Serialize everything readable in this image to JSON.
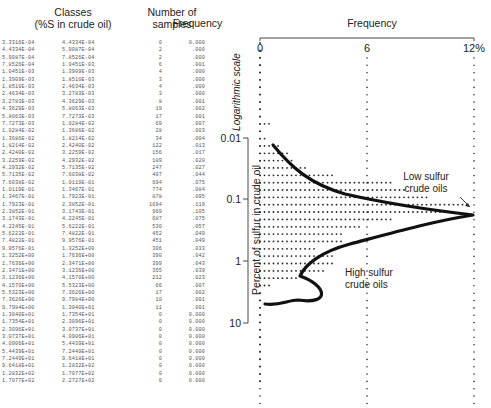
{
  "table": {
    "headers": {
      "classes_line1": "Classes",
      "classes_line2": "(%S in crude oil)",
      "samples_line1": "Number of",
      "samples_line2": "samples",
      "frequency": "Frequency"
    },
    "rows": [
      [
        "3.3316E-04",
        "4.4334E-04",
        "0",
        "0.000"
      ],
      [
        "4.4334E-04",
        "5.9087E-04",
        "2",
        ".000"
      ],
      [
        "5.9087E-04",
        "7.8526E-04",
        "2",
        ".000"
      ],
      [
        "7.8526E-04",
        "1.0451E-03",
        "6",
        ".001"
      ],
      [
        "1.0451E-03",
        "1.3909E-03",
        "4",
        ".000"
      ],
      [
        "1.3909E-03",
        "1.8510E-03",
        "3",
        ".000"
      ],
      [
        "1.8510E-03",
        "2.4634E-03",
        "4",
        ".000"
      ],
      [
        "2.4634E-03",
        "3.2783E-03",
        "3",
        ".000"
      ],
      [
        "3.2783E-03",
        "4.3629E-03",
        "8",
        ".001"
      ],
      [
        "4.3629E-03",
        "5.8063E-03",
        "19",
        ".002"
      ],
      [
        "5.8063E-03",
        "7.7273E-03",
        "17",
        ".001"
      ],
      [
        "7.7273E-03",
        "1.0284E-02",
        "69",
        ".007"
      ],
      [
        "1.0284E-02",
        "1.3686E-02",
        "28",
        ".003"
      ],
      [
        "1.3686E-02",
        "1.8214E-02",
        "34",
        ".004"
      ],
      [
        "1.8214E-02",
        "2.4240E-02",
        "122",
        ".013"
      ],
      [
        "2.4240E-02",
        "3.2259E-02",
        "156",
        ".017"
      ],
      [
        "3.2259E-02",
        "4.2932E-02",
        "189",
        ".020"
      ],
      [
        "4.2932E-02",
        "5.7135E-02",
        "247",
        ".027"
      ],
      [
        "5.7135E-02",
        "7.6038E-02",
        "407",
        ".044"
      ],
      [
        "7.6038E-02",
        "1.0119E-01",
        "694",
        ".075"
      ],
      [
        "1.0119E-01",
        "1.3467E-01",
        "774",
        ".084"
      ],
      [
        "1.3467E-01",
        "1.7923E-01",
        "878",
        ".095"
      ],
      [
        "1.7923E-01",
        "2.3852E-01",
        "1094",
        ".119"
      ],
      [
        "2.3852E-01",
        "3.1743E-01",
        "969",
        ".105"
      ],
      [
        "3.1743E-01",
        "4.2245E-01",
        "687",
        ".075"
      ],
      [
        "4.2245E-01",
        "5.6222E-01",
        "530",
        ".057"
      ],
      [
        "5.6222E-01",
        "7.4822E-01",
        "452",
        ".049"
      ],
      [
        "7.4822E-01",
        "9.9576E-01",
        "451",
        ".049"
      ],
      [
        "9.9576E-01",
        "1.3252E+00",
        "306",
        ".033"
      ],
      [
        "1.3252E+00",
        "1.7636E+00",
        "390",
        ".042"
      ],
      [
        "1.7636E+00",
        "2.3471E+00",
        "399",
        ".043"
      ],
      [
        "2.3471E+00",
        "3.1236E+00",
        "365",
        ".039"
      ],
      [
        "3.1236E+00",
        "4.1570E+00",
        "212",
        ".023"
      ],
      [
        "4.1570E+00",
        "5.5323E+00",
        "66",
        ".007"
      ],
      [
        "5.5323E+00",
        "7.3626E+00",
        "17",
        ".002"
      ],
      [
        "7.3626E+00",
        "9.7984E+00",
        "10",
        ".001"
      ],
      [
        "9.7984E+00",
        "1.3040E+01",
        "11",
        ".001"
      ],
      [
        "1.3040E+01",
        "1.7354E+01",
        "0",
        "0.000"
      ],
      [
        "1.7354E+01",
        "2.3096E+01",
        "0",
        "0.000"
      ],
      [
        "2.3096E+01",
        "3.0737E+01",
        "0",
        "0.000"
      ],
      [
        "3.0737E+01",
        "4.0906E+01",
        "0",
        "0.000"
      ],
      [
        "4.0906E+01",
        "5.4439E+01",
        "0",
        "0.000"
      ],
      [
        "5.4439E+01",
        "7.2449E+01",
        "0",
        "0.000"
      ],
      [
        "7.2449E+01",
        "9.6418E+01",
        "0",
        "0.000"
      ],
      [
        "9.6418E+01",
        "1.2832E+02",
        "0",
        "0.000"
      ],
      [
        "1.2832E+02",
        "1.7077E+02",
        "0",
        "0.000"
      ],
      [
        "1.7077E+02",
        "2.2727E+02",
        "0",
        "0.000"
      ]
    ]
  },
  "chart_data": {
    "type": "bar",
    "orientation": "horizontal",
    "title": "Frequency",
    "xlabel": "Frequency",
    "ylabel": "Percent of sulfur in crude oil",
    "y_scale_note": "Logarithmic scale",
    "x_ticks": [
      "0",
      "6",
      "12%"
    ],
    "xlim": [
      0,
      12
    ],
    "y_ticks": [
      "0.01",
      "0.1",
      "1",
      "10"
    ],
    "ylim": [
      0.00033,
      227
    ],
    "grid": "dotted vertical lines at 0, 6, 12",
    "annotations": [
      {
        "text_line1": "Low sulfur",
        "text_line2": "crude oils",
        "points_to": "peak near 0.2% S (~11.9%)"
      },
      {
        "text_line1": "High sulfur",
        "text_line2": "crude oils",
        "points_to": "secondary mode near 2% S (~4.3%)"
      }
    ],
    "categories": [
      "3.33E-04",
      "4.43E-04",
      "5.91E-04",
      "7.85E-04",
      "1.05E-03",
      "1.39E-03",
      "1.85E-03",
      "2.46E-03",
      "3.28E-03",
      "4.36E-03",
      "5.81E-03",
      "7.73E-03",
      "1.03E-02",
      "1.37E-02",
      "1.82E-02",
      "2.42E-02",
      "3.23E-02",
      "4.29E-02",
      "5.71E-02",
      "7.60E-02",
      "1.01E-01",
      "1.35E-01",
      "1.79E-01",
      "2.39E-01",
      "3.17E-01",
      "4.22E-01",
      "5.62E-01",
      "7.48E-01",
      "9.96E-01",
      "1.33E+00",
      "1.76E+00",
      "2.35E+00",
      "3.12E+00",
      "4.16E+00",
      "5.53E+00",
      "7.36E+00",
      "9.80E+00",
      "1.30E+01",
      "1.74E+01",
      "2.31E+01",
      "3.07E+01",
      "4.09E+01",
      "5.44E+01",
      "7.24E+01",
      "9.64E+01",
      "1.28E+02",
      "1.71E+02"
    ],
    "values": [
      0.0,
      0.0,
      0.0,
      0.1,
      0.0,
      0.0,
      0.0,
      0.0,
      0.1,
      0.2,
      0.1,
      0.7,
      0.3,
      0.4,
      1.3,
      1.7,
      2.0,
      2.7,
      4.4,
      7.5,
      8.4,
      9.5,
      11.9,
      10.5,
      7.5,
      5.7,
      4.9,
      4.9,
      3.3,
      4.2,
      4.3,
      3.9,
      2.3,
      0.7,
      0.2,
      0.1,
      0.1,
      0,
      0,
      0,
      0,
      0,
      0,
      0,
      0,
      0,
      0
    ]
  }
}
